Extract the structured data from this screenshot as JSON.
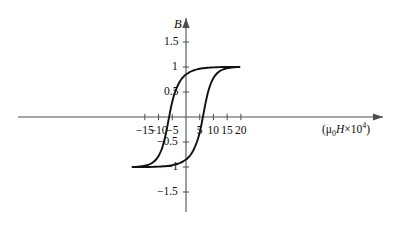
{
  "chart_data": {
    "type": "line",
    "title": "",
    "subtitle": "",
    "xlabel": "(μ₀H×10⁴)",
    "ylabel": "B",
    "xlim": [
      -19.5,
      23.5
    ],
    "ylim": [
      -1.85,
      1.85
    ],
    "grid": false,
    "legend": "none",
    "xticks": [
      -15,
      -10,
      -5,
      5,
      10,
      15,
      20
    ],
    "xtick_labels": [
      "−15",
      "−10",
      "−5",
      "5",
      "10",
      "15",
      "20"
    ],
    "yticks": [
      1.5,
      1,
      0.5,
      -0.5,
      -1,
      -1.5
    ],
    "ytick_labels": [
      "1.5",
      "1",
      "0.5",
      "−0.5",
      "−1",
      "−1.5"
    ],
    "saturation_B": 1.0,
    "remanence_B": 0.85,
    "coercivity_H": 6.8,
    "series": [
      {
        "name": "upper-branch",
        "comment": "descending branch: from positive saturation at right, through positive remanence, crossing zero at negative coercive field, to negative saturation at left",
        "points": [
          [
            -18.6,
            -1.0
          ],
          [
            -17.5,
            -0.995
          ],
          [
            -16.0,
            -0.985
          ],
          [
            -15.0,
            -0.975
          ],
          [
            -14.0,
            -0.96
          ],
          [
            -13.0,
            -0.94
          ],
          [
            -12.0,
            -0.905
          ],
          [
            -11.0,
            -0.855
          ],
          [
            -10.0,
            -0.78
          ],
          [
            -9.0,
            -0.665
          ],
          [
            -8.5,
            -0.585
          ],
          [
            -8.0,
            -0.49
          ],
          [
            -7.5,
            -0.375
          ],
          [
            -7.0,
            -0.245
          ],
          [
            -6.8,
            -0.19
          ],
          [
            -6.5,
            -0.1
          ],
          [
            -6.2,
            -0.015
          ],
          [
            -6.0,
            0.045
          ],
          [
            -5.5,
            0.185
          ],
          [
            -5.0,
            0.305
          ],
          [
            -4.5,
            0.41
          ],
          [
            -4.0,
            0.495
          ],
          [
            -3.5,
            0.565
          ],
          [
            -3.0,
            0.63
          ],
          [
            -2.5,
            0.685
          ],
          [
            -2.0,
            0.73
          ],
          [
            -1.5,
            0.77
          ],
          [
            -1.0,
            0.8
          ],
          [
            -0.5,
            0.83
          ],
          [
            0.0,
            0.85
          ],
          [
            1.0,
            0.885
          ],
          [
            2.0,
            0.915
          ],
          [
            3.0,
            0.935
          ],
          [
            4.0,
            0.952
          ],
          [
            5.0,
            0.965
          ],
          [
            6.0,
            0.974
          ],
          [
            7.0,
            0.981
          ],
          [
            8.0,
            0.986
          ],
          [
            9.0,
            0.99
          ],
          [
            10.0,
            0.993
          ],
          [
            12.0,
            0.997
          ],
          [
            14.0,
            0.999
          ],
          [
            16.0,
            1.0
          ],
          [
            19.5,
            1.0
          ]
        ]
      },
      {
        "name": "lower-branch",
        "comment": "ascending branch: point symmetric about the origin with respect to the upper branch",
        "points": [
          [
            18.6,
            1.0
          ],
          [
            17.5,
            0.995
          ],
          [
            16.0,
            0.985
          ],
          [
            15.0,
            0.975
          ],
          [
            14.0,
            0.96
          ],
          [
            13.0,
            0.94
          ],
          [
            12.0,
            0.905
          ],
          [
            11.0,
            0.855
          ],
          [
            10.0,
            0.78
          ],
          [
            9.0,
            0.665
          ],
          [
            8.5,
            0.585
          ],
          [
            8.0,
            0.49
          ],
          [
            7.5,
            0.375
          ],
          [
            7.0,
            0.245
          ],
          [
            6.8,
            0.19
          ],
          [
            6.5,
            0.1
          ],
          [
            6.2,
            0.015
          ],
          [
            6.0,
            -0.045
          ],
          [
            5.5,
            -0.185
          ],
          [
            5.0,
            -0.305
          ],
          [
            4.5,
            -0.41
          ],
          [
            4.0,
            -0.495
          ],
          [
            3.5,
            -0.565
          ],
          [
            3.0,
            -0.63
          ],
          [
            2.5,
            -0.685
          ],
          [
            2.0,
            -0.73
          ],
          [
            1.5,
            -0.77
          ],
          [
            1.0,
            -0.8
          ],
          [
            0.5,
            -0.83
          ],
          [
            0.0,
            -0.85
          ],
          [
            -1.0,
            -0.885
          ],
          [
            -2.0,
            -0.915
          ],
          [
            -3.0,
            -0.935
          ],
          [
            -4.0,
            -0.952
          ],
          [
            -5.0,
            -0.965
          ],
          [
            -6.0,
            -0.974
          ],
          [
            -7.0,
            -0.981
          ],
          [
            -8.0,
            -0.986
          ],
          [
            -9.0,
            -0.99
          ],
          [
            -10.0,
            -0.993
          ],
          [
            -12.0,
            -0.997
          ],
          [
            -14.0,
            -0.999
          ],
          [
            -16.0,
            -1.0
          ],
          [
            -19.5,
            -1.0
          ]
        ]
      }
    ]
  },
  "axes": {
    "y_axis_label": "B",
    "x_axis_label_parts": {
      "open": "(",
      "mu": "μ",
      "mu_sub": "0",
      "h": "H",
      "times": "×",
      "base": "10",
      "exponent": "4",
      "close": ")"
    }
  },
  "colors": {
    "curve": "#111111",
    "axis": "#4d4d4d",
    "text": "#0d0d0d",
    "background": "#ffffff"
  }
}
